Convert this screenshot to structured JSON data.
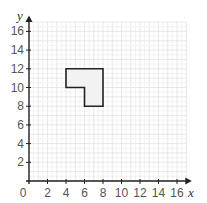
{
  "chart_data": {
    "type": "diagram",
    "title": "",
    "xlabel": "x",
    "ylabel": "y",
    "xlim": [
      0,
      17
    ],
    "ylim": [
      0,
      17
    ],
    "grid": true,
    "x_ticks": [
      0,
      2,
      4,
      6,
      8,
      10,
      12,
      14,
      16
    ],
    "y_ticks": [
      2,
      4,
      6,
      8,
      10,
      12,
      14,
      16
    ],
    "shapes": [
      {
        "name": "L-shape",
        "vertices": [
          [
            4,
            12
          ],
          [
            8,
            12
          ],
          [
            8,
            8
          ],
          [
            6,
            8
          ],
          [
            6,
            10
          ],
          [
            4,
            10
          ]
        ],
        "fill": "#f2f2f2",
        "stroke": "#222222"
      }
    ]
  },
  "labels": {
    "x_axis": "x",
    "y_axis": "y",
    "origin": "0",
    "x_ticks": [
      "2",
      "4",
      "6",
      "8",
      "10",
      "12",
      "14",
      "16"
    ],
    "y_ticks": [
      "2",
      "4",
      "6",
      "8",
      "10",
      "12",
      "14",
      "16"
    ]
  }
}
